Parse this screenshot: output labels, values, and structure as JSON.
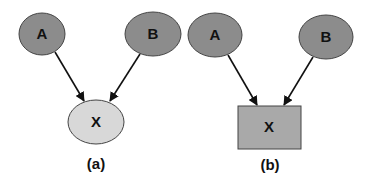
{
  "diagram": {
    "panels": [
      {
        "caption": "(a)",
        "nodes": [
          {
            "id": "A",
            "label": "A",
            "shape": "ellipse",
            "fill": "#8c8c8c"
          },
          {
            "id": "B",
            "label": "B",
            "shape": "ellipse",
            "fill": "#8c8c8c"
          },
          {
            "id": "X",
            "label": "X",
            "shape": "ellipse",
            "fill": "#d8d8d8"
          }
        ],
        "edges": [
          {
            "from": "A",
            "to": "X"
          },
          {
            "from": "B",
            "to": "X"
          }
        ]
      },
      {
        "caption": "(b)",
        "nodes": [
          {
            "id": "A",
            "label": "A",
            "shape": "ellipse",
            "fill": "#8c8c8c"
          },
          {
            "id": "B",
            "label": "B",
            "shape": "ellipse",
            "fill": "#8c8c8c"
          },
          {
            "id": "X",
            "label": "X",
            "shape": "rectangle",
            "fill": "#a9a9a9"
          }
        ],
        "edges": [
          {
            "from": "A",
            "to": "X"
          },
          {
            "from": "B",
            "to": "X"
          }
        ]
      }
    ]
  }
}
